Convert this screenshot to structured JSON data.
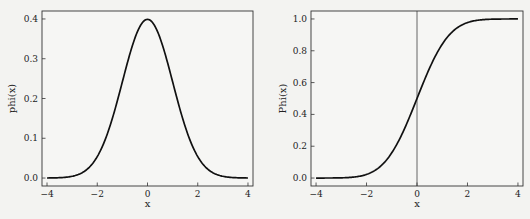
{
  "chart_data": [
    {
      "type": "line",
      "title": "",
      "xlabel": "x",
      "ylabel": "phi(x)",
      "xlim": [
        -4.2,
        4.2
      ],
      "ylim": [
        -0.02,
        0.42
      ],
      "xticks": [
        -4,
        -2,
        0,
        2,
        4
      ],
      "xtick_labels": [
        "−4",
        "−2",
        "0",
        "2",
        "4"
      ],
      "yticks": [
        0.0,
        0.1,
        0.2,
        0.3,
        0.4
      ],
      "ytick_labels": [
        "0.0",
        "0.1",
        "0.2",
        "0.3",
        "0.4"
      ],
      "grid": false,
      "legend": null,
      "series": [
        {
          "name": "phi(x)",
          "x": [
            -4,
            -3.5,
            -3,
            -2.5,
            -2,
            -1.5,
            -1,
            -0.5,
            0,
            0.5,
            1,
            1.5,
            2,
            2.5,
            3,
            3.5,
            4
          ],
          "values": [
            0.0001,
            0.0009,
            0.0044,
            0.0175,
            0.054,
            0.1295,
            0.242,
            0.3521,
            0.3989,
            0.3521,
            0.242,
            0.1295,
            0.054,
            0.0175,
            0.0044,
            0.0009,
            0.0001
          ]
        }
      ]
    },
    {
      "type": "line",
      "title": "",
      "xlabel": "x",
      "ylabel": "Phi(x)",
      "xlim": [
        -4.2,
        4.2
      ],
      "ylim": [
        -0.05,
        1.05
      ],
      "xticks": [
        -4,
        -2,
        0,
        2,
        4
      ],
      "xtick_labels": [
        "−4",
        "−2",
        "0",
        "2",
        "4"
      ],
      "yticks": [
        0.0,
        0.2,
        0.4,
        0.6,
        0.8,
        1.0
      ],
      "ytick_labels": [
        "0.0",
        "0.2",
        "0.4",
        "0.6",
        "0.8",
        "1.0"
      ],
      "grid": false,
      "legend": null,
      "annotations": [
        {
          "type": "vline",
          "x": 0
        }
      ],
      "series": [
        {
          "name": "Phi(x)",
          "x": [
            -4,
            -3.5,
            -3,
            -2.5,
            -2,
            -1.5,
            -1,
            -0.5,
            0,
            0.5,
            1,
            1.5,
            2,
            2.5,
            3,
            3.5,
            4
          ],
          "values": [
            0.0,
            0.0002,
            0.0013,
            0.0062,
            0.0228,
            0.0668,
            0.1587,
            0.3085,
            0.5,
            0.6915,
            0.8413,
            0.9332,
            0.9772,
            0.9938,
            0.9987,
            0.9998,
            1.0
          ]
        }
      ]
    }
  ]
}
